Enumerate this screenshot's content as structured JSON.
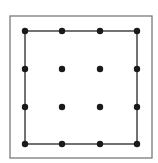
{
  "diagram": {
    "type": "geoboard",
    "colors": {
      "background": "#ffffff",
      "frame": "#7a7a7a",
      "square": "#444444",
      "dot": "#1a1a1a"
    },
    "frame": {
      "x": 10,
      "y": 16,
      "width": 142,
      "height": 142
    },
    "grid": {
      "columns": 4,
      "rows": 4,
      "x": [
        25,
        62,
        100,
        137
      ],
      "y": [
        31,
        69,
        107,
        144
      ],
      "dot_radius": 3.2
    },
    "square": {
      "corners": [
        [
          25,
          31
        ],
        [
          137,
          31
        ],
        [
          137,
          144
        ],
        [
          25,
          144
        ]
      ]
    }
  }
}
